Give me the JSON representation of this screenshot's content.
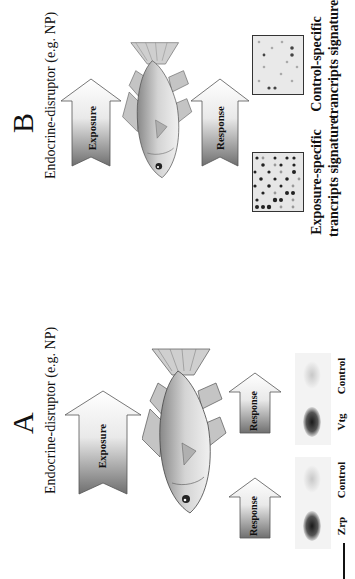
{
  "figure": {
    "orientation": "rotated-90-counterclockwise",
    "panels": [
      {
        "letter": "A",
        "subtitle": "Endocrine-disruptor (e.g. NP)",
        "exposure_arrow": {
          "label": "Exposure"
        },
        "organism": "fish",
        "response_arrows": [
          {
            "label": "Response"
          },
          {
            "label": "Response"
          }
        ],
        "blots": [
          {
            "lanes": [
              "Zrp",
              "Control"
            ],
            "intensity": [
              0.85,
              0.12
            ]
          },
          {
            "lanes": [
              "Vtg",
              "Control"
            ],
            "intensity": [
              0.85,
              0.12
            ]
          }
        ]
      },
      {
        "letter": "B",
        "subtitle": "Endocrine-disruptor (e.g. NP)",
        "exposure_arrow": {
          "label": "Exposure"
        },
        "organism": "fish",
        "response_arrow": {
          "label": "Response"
        },
        "signatures": [
          {
            "line1": "Exposure-specific",
            "line2": "trancripts signature"
          },
          {
            "line1": "Control-specific",
            "line2": "trancripts signature"
          }
        ]
      }
    ],
    "colors": {
      "text": "#111111",
      "arrow_dark": "#7a7a7a",
      "arrow_light": "#f4f4f4",
      "fish_body": "#b9b9b9",
      "background": "#ffffff"
    }
  }
}
